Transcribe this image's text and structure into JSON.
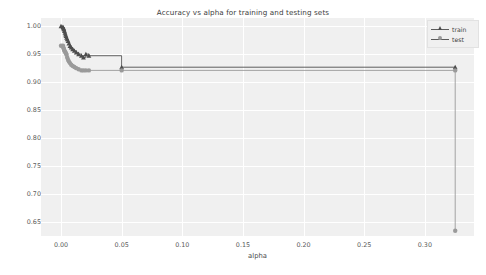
{
  "chart_data": {
    "type": "line",
    "title": "Accuracy vs alpha for training and testing sets",
    "xlabel": "alpha",
    "ylabel": "accuracy",
    "drawstyle": "steps-post",
    "grid": true,
    "grid_color": "#ffffff",
    "axes_facecolor": "#f0f0f0",
    "legend_position": "upper right",
    "xlim": [
      -0.0165,
      0.3405
    ],
    "ylim": [
      0.6255,
      1.0145
    ],
    "xticks": [
      0.0,
      0.05,
      0.1,
      0.15,
      0.2,
      0.25,
      0.3
    ],
    "xtick_labels": [
      "0.00",
      "0.05",
      "0.10",
      "0.15",
      "0.20",
      "0.25",
      "0.30"
    ],
    "yticks": [
      0.65,
      0.7,
      0.75,
      0.8,
      0.85,
      0.9,
      0.95,
      1.0
    ],
    "ytick_labels": [
      "0.65",
      "0.70",
      "0.75",
      "0.80",
      "0.85",
      "0.90",
      "0.95",
      "1.00"
    ],
    "series": [
      {
        "name": "train",
        "marker": "triangle",
        "color": "#4d4d4d",
        "points": [
          {
            "x": 0.0,
            "y": 1.0
          },
          {
            "x": 0.0016,
            "y": 0.9985
          },
          {
            "x": 0.0019,
            "y": 0.997
          },
          {
            "x": 0.0022,
            "y": 0.9956
          },
          {
            "x": 0.0025,
            "y": 0.9941
          },
          {
            "x": 0.0028,
            "y": 0.9912
          },
          {
            "x": 0.0033,
            "y": 0.9883
          },
          {
            "x": 0.0037,
            "y": 0.9853
          },
          {
            "x": 0.0041,
            "y": 0.9824
          },
          {
            "x": 0.0046,
            "y": 0.9795
          },
          {
            "x": 0.0051,
            "y": 0.9765
          },
          {
            "x": 0.0058,
            "y": 0.9736
          },
          {
            "x": 0.0065,
            "y": 0.9692
          },
          {
            "x": 0.0074,
            "y": 0.9648
          },
          {
            "x": 0.0084,
            "y": 0.9619
          },
          {
            "x": 0.0096,
            "y": 0.9589
          },
          {
            "x": 0.011,
            "y": 0.956
          },
          {
            "x": 0.0126,
            "y": 0.9531
          },
          {
            "x": 0.0145,
            "y": 0.9501
          },
          {
            "x": 0.0168,
            "y": 0.9472
          },
          {
            "x": 0.0185,
            "y": 0.9443
          },
          {
            "x": 0.0205,
            "y": 0.9501
          },
          {
            "x": 0.023,
            "y": 0.9472
          },
          {
            "x": 0.05,
            "y": 0.9267
          },
          {
            "x": 0.325,
            "y": 0.9267
          }
        ]
      },
      {
        "name": "test",
        "marker": "circle",
        "color": "#9a9a9a",
        "points": [
          {
            "x": 0.0,
            "y": 0.965
          },
          {
            "x": 0.0016,
            "y": 0.965
          },
          {
            "x": 0.0019,
            "y": 0.962
          },
          {
            "x": 0.0022,
            "y": 0.96
          },
          {
            "x": 0.0025,
            "y": 0.958
          },
          {
            "x": 0.0028,
            "y": 0.956
          },
          {
            "x": 0.0033,
            "y": 0.9545
          },
          {
            "x": 0.0037,
            "y": 0.953
          },
          {
            "x": 0.0041,
            "y": 0.951
          },
          {
            "x": 0.0046,
            "y": 0.949
          },
          {
            "x": 0.0051,
            "y": 0.944
          },
          {
            "x": 0.0058,
            "y": 0.94
          },
          {
            "x": 0.0065,
            "y": 0.937
          },
          {
            "x": 0.0074,
            "y": 0.934
          },
          {
            "x": 0.0084,
            "y": 0.931
          },
          {
            "x": 0.0096,
            "y": 0.929
          },
          {
            "x": 0.011,
            "y": 0.927
          },
          {
            "x": 0.0126,
            "y": 0.925
          },
          {
            "x": 0.0145,
            "y": 0.923
          },
          {
            "x": 0.0168,
            "y": 0.921
          },
          {
            "x": 0.0185,
            "y": 0.921
          },
          {
            "x": 0.0205,
            "y": 0.921
          },
          {
            "x": 0.023,
            "y": 0.921
          },
          {
            "x": 0.05,
            "y": 0.921
          },
          {
            "x": 0.325,
            "y": 0.921
          },
          {
            "x": 0.325,
            "y": 0.635
          }
        ]
      }
    ]
  },
  "legend": {
    "entries": [
      {
        "label": "train",
        "marker": "triangle"
      },
      {
        "label": "test",
        "marker": "circle"
      }
    ]
  }
}
